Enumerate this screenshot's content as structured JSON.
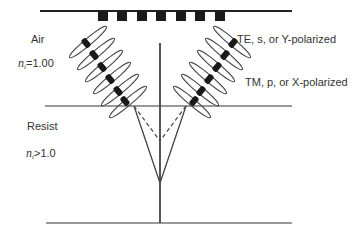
{
  "diagram": {
    "title": "",
    "media": {
      "top": {
        "name": "Air",
        "index_symbol": "n",
        "index_subscript": "i",
        "index_value": "=1.00"
      },
      "bottom": {
        "name": "Resist",
        "index_symbol": "n",
        "index_subscript": "i",
        "index_value": ">1.0"
      }
    },
    "polarization_labels": {
      "te": "TE, s, or Y-polarized",
      "tm": "TM, p, or X-polarized"
    },
    "mask": {
      "opaque_blocks": 7
    },
    "beam_lobes_per_side": 6,
    "colors": {
      "line": "#555555",
      "text": "#333333",
      "dipole": "#1a1a1a"
    }
  }
}
